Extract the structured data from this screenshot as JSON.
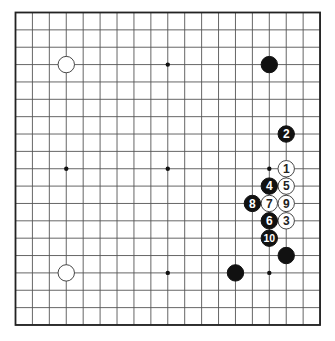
{
  "board": {
    "size": 19,
    "origin_x": 15.5,
    "origin_y": 12.5,
    "step_x": 16.92,
    "step_y": 17.36,
    "line_color": "#555555",
    "border_color": "#222222",
    "star_points": [
      [
        3,
        3
      ],
      [
        9,
        3
      ],
      [
        15,
        3
      ],
      [
        3,
        9
      ],
      [
        9,
        9
      ],
      [
        15,
        9
      ],
      [
        3,
        15
      ],
      [
        9,
        15
      ],
      [
        15,
        15
      ]
    ],
    "stones": [
      {
        "col": 3,
        "row": 3,
        "color": "white",
        "label": ""
      },
      {
        "col": 15,
        "row": 3,
        "color": "black",
        "label": ""
      },
      {
        "col": 3,
        "row": 15,
        "color": "white",
        "label": ""
      },
      {
        "col": 16,
        "row": 14,
        "color": "black",
        "label": ""
      },
      {
        "col": 13,
        "row": 15,
        "color": "black",
        "label": ""
      },
      {
        "col": 16,
        "row": 9,
        "color": "white",
        "label": "1"
      },
      {
        "col": 16,
        "row": 7,
        "color": "black",
        "label": "2"
      },
      {
        "col": 16,
        "row": 12,
        "color": "white",
        "label": "3"
      },
      {
        "col": 15,
        "row": 10,
        "color": "black",
        "label": "4"
      },
      {
        "col": 16,
        "row": 10,
        "color": "white",
        "label": "5"
      },
      {
        "col": 15,
        "row": 12,
        "color": "black",
        "label": "6"
      },
      {
        "col": 15,
        "row": 11,
        "color": "white",
        "label": "7"
      },
      {
        "col": 14,
        "row": 11,
        "color": "black",
        "label": "8"
      },
      {
        "col": 16,
        "row": 11,
        "color": "white",
        "label": "9"
      },
      {
        "col": 15,
        "row": 13,
        "color": "black",
        "label": "10"
      }
    ]
  }
}
